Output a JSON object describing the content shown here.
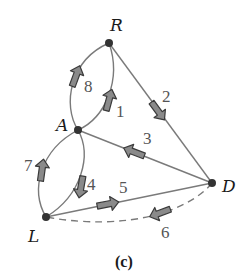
{
  "figure": {
    "caption": "(c)",
    "colors": {
      "background": "#ffffff",
      "edge": "#7a7a7a",
      "node": "#333333",
      "arrow_fill": "#8a8a8a",
      "arrow_stroke": "#3a3a3a",
      "label": "#555555"
    },
    "nodes": [
      {
        "id": "R",
        "label": "R"
      },
      {
        "id": "A",
        "label": "A"
      },
      {
        "id": "D",
        "label": "D"
      },
      {
        "id": "L",
        "label": "L"
      }
    ],
    "edges": [
      {
        "id": "e1",
        "label": "1",
        "from": "A",
        "to": "R",
        "style": "solid"
      },
      {
        "id": "e2",
        "label": "2",
        "from": "R",
        "to": "D",
        "style": "solid"
      },
      {
        "id": "e3",
        "label": "3",
        "from": "D",
        "to": "A",
        "style": "solid"
      },
      {
        "id": "e4",
        "label": "4",
        "from": "A",
        "to": "L",
        "style": "solid"
      },
      {
        "id": "e5",
        "label": "5",
        "from": "L",
        "to": "D",
        "style": "solid"
      },
      {
        "id": "e6",
        "label": "6",
        "from": "D",
        "to": "L",
        "style": "dashed"
      },
      {
        "id": "e7",
        "label": "7",
        "from": "L",
        "to": "A",
        "style": "solid"
      },
      {
        "id": "e8",
        "label": "8",
        "from": "A",
        "to": "R",
        "style": "solid"
      }
    ]
  }
}
